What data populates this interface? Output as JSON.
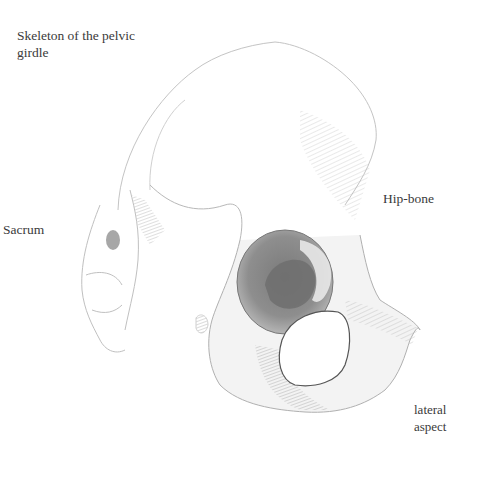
{
  "figure": {
    "title": "Skeleton of the pelvic girdle",
    "labels": {
      "sacrum": "Sacrum",
      "hip_bone": "Hip-bone",
      "view": "lateral aspect"
    },
    "colors": {
      "background": "#ffffff",
      "text": "#3a3a3a",
      "pencil_light": "#c8c8c8",
      "pencil_mid": "#9a9a9a",
      "pencil_dark": "#6e6e6e"
    }
  }
}
